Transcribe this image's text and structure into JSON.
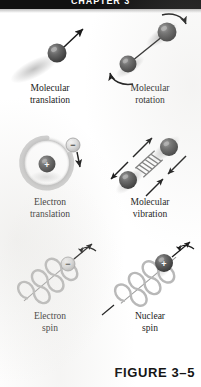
{
  "page": {
    "running_head": "CHAPTER 3",
    "background_color": "#ffffff",
    "header_bar_color": "#111111"
  },
  "figure": {
    "number_label": "FIGURE 3–5",
    "panels": [
      {
        "id": "molecular-translation",
        "caption_line1": "Molecular",
        "caption_line2": "translation",
        "icon": "sphere-with-straight-arrow"
      },
      {
        "id": "molecular-rotation",
        "caption_line1": "Molecular",
        "caption_line2": "rotation",
        "icon": "two-spheres-bond-with-curved-arrows"
      },
      {
        "id": "electron-translation",
        "caption_line1": "Electron",
        "caption_line2": "translation",
        "icon": "nucleus-orbit-with-electron-arrow"
      },
      {
        "id": "molecular-vibration",
        "caption_line1": "Molecular",
        "caption_line2": "vibration",
        "icon": "two-spheres-spring-with-arrows"
      },
      {
        "id": "electron-spin",
        "caption_line1": "Electron",
        "caption_line2": "spin",
        "icon": "electron-helix-spin-arrow"
      },
      {
        "id": "nuclear-spin",
        "caption_line1": "Nuclear",
        "caption_line2": "spin",
        "icon": "nucleus-helix-spin-arrow"
      }
    ]
  },
  "symbols": {
    "positive_charge": "+",
    "negative_charge": "−"
  },
  "colors": {
    "sphere_dark": "#4a4a4a",
    "sphere_light": "#d8d8d8",
    "helix_grey": "#b8b8b8",
    "arrow_black": "#1a1a1a",
    "shadow_grey": "#c9c9c9",
    "text_black": "#1b1b1b"
  }
}
